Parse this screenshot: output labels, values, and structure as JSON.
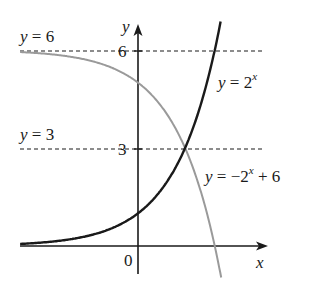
{
  "chart_data": {
    "type": "line",
    "title": "",
    "xlabel": "x",
    "ylabel": "y",
    "origin_label": "0",
    "y_ticks": [
      {
        "value": 3,
        "label": "3"
      },
      {
        "value": 6,
        "label": "6"
      }
    ],
    "reference_lines": [
      {
        "label": "y = 6",
        "y": 6,
        "style": "dashed"
      },
      {
        "label": "y = 3",
        "y": 3,
        "style": "dashed"
      }
    ],
    "series": [
      {
        "name": "y = 2^x",
        "label_main": "y = 2",
        "label_sup": "x",
        "color": "#1a1a1a",
        "x": [
          -4,
          -3,
          -2,
          -1,
          0,
          1,
          1.585,
          2,
          2.5,
          2.78
        ],
        "y": [
          0.0625,
          0.125,
          0.25,
          0.5,
          1,
          2,
          3,
          4,
          5.66,
          6.87
        ]
      },
      {
        "name": "y = -2^x + 6",
        "label_main": "y = −2",
        "label_sup": "x",
        "label_tail": " + 6",
        "color": "#999999",
        "x": [
          -4,
          -3,
          -2,
          -1,
          0,
          1,
          1.585,
          2,
          2.585,
          2.8
        ],
        "y": [
          5.94,
          5.88,
          5.75,
          5.5,
          5,
          4,
          3,
          2,
          0,
          -0.96
        ]
      }
    ],
    "intersection": {
      "x": 1.585,
      "y": 3
    },
    "xlim": [
      -4,
      4
    ],
    "ylim": [
      -1,
      7.2
    ],
    "grid": false,
    "legend": "inline labels"
  }
}
